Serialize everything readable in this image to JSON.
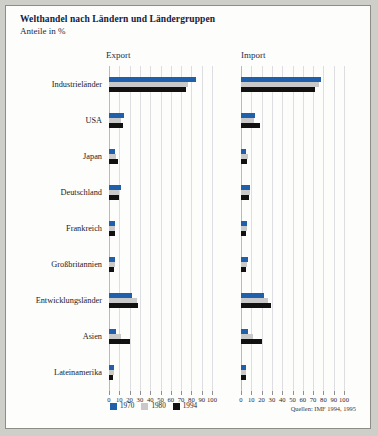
{
  "title": "Welthandel nach Ländern und Ländergruppen",
  "subtitle": "Anteile in %",
  "panels": [
    {
      "label": "Export"
    },
    {
      "label": "Import"
    }
  ],
  "legend": [
    {
      "label": "1970",
      "color": "#1f5fab"
    },
    {
      "label": "1980",
      "color": "#c9c9c9"
    },
    {
      "label": "1994",
      "color": "#111111"
    }
  ],
  "source": "Quellen: IMF 1994, 1995",
  "axis": {
    "ticks": [
      "0",
      "10",
      "20",
      "30",
      "40",
      "50",
      "60",
      "70",
      "80",
      "90",
      "100"
    ],
    "min": 0,
    "max": 100
  },
  "chart_data": {
    "type": "bar",
    "title": "Welthandel nach Ländern und Ländergruppen",
    "subtitle": "Anteile in %",
    "orientation": "horizontal",
    "grouped": true,
    "grid": true,
    "legend_position": "bottom-left",
    "xlabel": "",
    "ylabel": "",
    "xlim": [
      0,
      100
    ],
    "xticks": [
      0,
      10,
      20,
      30,
      40,
      50,
      60,
      70,
      80,
      90,
      100
    ],
    "categories": [
      "Industrieländer",
      "USA",
      "Japan",
      "Deutschland",
      "Frankreich",
      "Großbritannien",
      "Entwicklungsländer",
      "Asien",
      "Lateinamerika"
    ],
    "panels": [
      {
        "name": "Export",
        "series": [
          {
            "name": "1970",
            "values": [
              84,
              15,
              6,
              12,
              6,
              6,
              22,
              7,
              5
            ]
          },
          {
            "name": "1980",
            "values": [
              77,
              12,
              7,
              10,
              6,
              6,
              27,
              12,
              5
            ]
          },
          {
            "name": "1994",
            "values": [
              75,
              14,
              9,
              10,
              6,
              5,
              28,
              20,
              4
            ]
          }
        ]
      },
      {
        "name": "Import",
        "series": [
          {
            "name": "1970",
            "values": [
              78,
              14,
              5,
              9,
              6,
              7,
              22,
              7,
              5
            ]
          },
          {
            "name": "1980",
            "values": [
              76,
              13,
              7,
              9,
              6,
              6,
              26,
              12,
              5
            ]
          },
          {
            "name": "1994",
            "values": [
              72,
              18,
              6,
              8,
              5,
              5,
              29,
              20,
              5
            ]
          }
        ]
      }
    ]
  }
}
